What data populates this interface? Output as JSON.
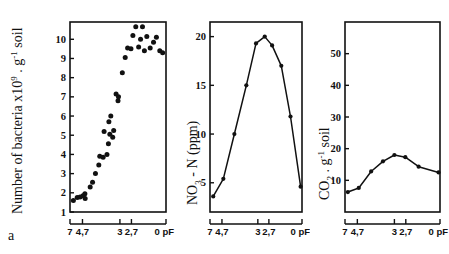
{
  "figure": {
    "panel_letter": "a",
    "x_axis_shared": {
      "label_unit": "pF",
      "tick_labels": [
        "7",
        "4,7",
        "3",
        "2,7",
        "0 pF"
      ],
      "tick_positions": [
        0.0,
        0.13,
        0.52,
        0.64,
        1.0
      ]
    }
  },
  "chart_data": [
    {
      "type": "scatter",
      "title": "",
      "panel": "a-left",
      "xlabel": "pF",
      "ylabel": "Number of bacteria x10⁹ . g⁻¹ soil",
      "ylabel_parts": {
        "prefix": "Number of bacteria x10",
        "exponent": "9",
        "mid": " . g",
        "exponent2": "-1",
        "suffix": " soil"
      },
      "xlim": [
        0,
        1
      ],
      "ylim": [
        1,
        10.9
      ],
      "ytick_labels": [
        "1",
        "2",
        "3",
        "4",
        "5",
        "6",
        "7",
        "8",
        "9",
        "10"
      ],
      "ytick_values": [
        1,
        2,
        3,
        4,
        5,
        6,
        7,
        8,
        9,
        10
      ],
      "xtick_labels": [
        "7",
        "4,7",
        "3",
        "2,7",
        "0 pF"
      ],
      "grid": false,
      "legend": false,
      "points": [
        {
          "x": 0.035,
          "y": 1.6
        },
        {
          "x": 0.075,
          "y": 1.75
        },
        {
          "x": 0.105,
          "y": 1.78
        },
        {
          "x": 0.135,
          "y": 1.85
        },
        {
          "x": 0.155,
          "y": 1.95
        },
        {
          "x": 0.158,
          "y": 1.7
        },
        {
          "x": 0.21,
          "y": 2.3
        },
        {
          "x": 0.235,
          "y": 2.55
        },
        {
          "x": 0.265,
          "y": 3.0
        },
        {
          "x": 0.3,
          "y": 3.45
        },
        {
          "x": 0.31,
          "y": 3.9
        },
        {
          "x": 0.345,
          "y": 3.85
        },
        {
          "x": 0.355,
          "y": 5.2
        },
        {
          "x": 0.385,
          "y": 4.0
        },
        {
          "x": 0.4,
          "y": 4.55
        },
        {
          "x": 0.405,
          "y": 5.7
        },
        {
          "x": 0.415,
          "y": 5.05
        },
        {
          "x": 0.425,
          "y": 6.0
        },
        {
          "x": 0.445,
          "y": 4.9
        },
        {
          "x": 0.455,
          "y": 5.25
        },
        {
          "x": 0.48,
          "y": 7.15
        },
        {
          "x": 0.5,
          "y": 6.8
        },
        {
          "x": 0.505,
          "y": 7.0
        },
        {
          "x": 0.545,
          "y": 8.25
        },
        {
          "x": 0.575,
          "y": 9.05
        },
        {
          "x": 0.6,
          "y": 9.55
        },
        {
          "x": 0.635,
          "y": 9.5
        },
        {
          "x": 0.655,
          "y": 10.2
        },
        {
          "x": 0.685,
          "y": 10.65
        },
        {
          "x": 0.715,
          "y": 9.6
        },
        {
          "x": 0.735,
          "y": 10.0
        },
        {
          "x": 0.755,
          "y": 10.65
        },
        {
          "x": 0.775,
          "y": 9.4
        },
        {
          "x": 0.8,
          "y": 10.15
        },
        {
          "x": 0.835,
          "y": 9.55
        },
        {
          "x": 0.87,
          "y": 9.85
        },
        {
          "x": 0.9,
          "y": 10.1
        },
        {
          "x": 0.935,
          "y": 9.4
        },
        {
          "x": 0.965,
          "y": 9.3
        }
      ]
    },
    {
      "type": "line",
      "title": "",
      "panel": "a-middle",
      "xlabel": "pF",
      "ylabel": "NO₃ - N (ppm)",
      "ylabel_parts": {
        "prefix": "NO",
        "subscript": "3",
        "suffix": " - N (ppm)"
      },
      "xlim": [
        0,
        1
      ],
      "ylim": [
        2,
        21.5
      ],
      "ytick_labels": [
        "5",
        "10",
        "15",
        "20"
      ],
      "ytick_values": [
        5,
        10,
        15,
        20
      ],
      "xtick_labels": [
        "7",
        "4,7",
        "3",
        "2,7",
        "0 pF"
      ],
      "grid": false,
      "legend": false,
      "x": [
        0.035,
        0.145,
        0.265,
        0.395,
        0.5,
        0.595,
        0.675,
        0.775,
        0.875,
        0.985
      ],
      "values": [
        3.6,
        5.4,
        10.0,
        15.0,
        19.3,
        20.0,
        19.1,
        17.0,
        11.8,
        4.6
      ]
    },
    {
      "type": "line",
      "title": "",
      "panel": "a-right",
      "xlabel": "pF",
      "ylabel": "CO₂ . g⁻¹ soil",
      "ylabel_parts": {
        "prefix": "CO",
        "subscript": "2",
        "mid": " . g",
        "exponent": "-1",
        "suffix": " soil"
      },
      "xlim": [
        0,
        1
      ],
      "ylim": [
        0,
        60
      ],
      "ytick_labels": [
        "10",
        "20",
        "30",
        "40",
        "50"
      ],
      "ytick_values": [
        10,
        20,
        30,
        40,
        50
      ],
      "xtick_labels": [
        "7",
        "4,7",
        "3",
        "2,7",
        "0 pF"
      ],
      "grid": false,
      "legend": false,
      "x": [
        0.03,
        0.145,
        0.275,
        0.4,
        0.52,
        0.635,
        0.775,
        0.985
      ],
      "values": [
        6.3,
        7.6,
        12.8,
        16.0,
        18.0,
        17.3,
        14.3,
        12.5
      ]
    }
  ]
}
